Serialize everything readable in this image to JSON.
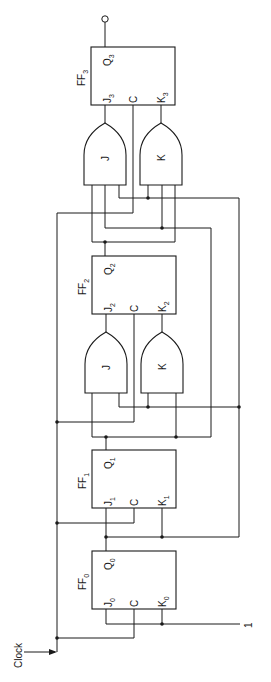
{
  "diagram": {
    "type": "synchronous counter (JK flip-flops with gate logic)",
    "orientation": "rotated 90deg counter-clockwise",
    "clock_label": "Clock",
    "constant_input_label": "1",
    "flip_flops": [
      {
        "id": "FF0",
        "name": "FF",
        "sub": "0",
        "q": "Q",
        "q_sub": "0",
        "j": "J",
        "j_sub": "0",
        "c": "C",
        "k": "K",
        "k_sub": "0"
      },
      {
        "id": "FF1",
        "name": "FF",
        "sub": "1",
        "q": "Q",
        "q_sub": "1",
        "j": "J",
        "j_sub": "1",
        "c": "C",
        "k": "K",
        "k_sub": "1"
      },
      {
        "id": "FF2",
        "name": "FF",
        "sub": "2",
        "q": "Q",
        "q_sub": "2",
        "j": "J",
        "j_sub": "2",
        "c": "C",
        "k": "K",
        "k_sub": "2"
      },
      {
        "id": "FF3",
        "name": "FF",
        "sub": "3",
        "q": "Q",
        "q_sub": "3",
        "j": "J",
        "j_sub": "3",
        "c": "C",
        "k": "K",
        "k_sub": "3"
      }
    ],
    "gates": [
      {
        "id": "FF2-J-gate",
        "label": "J"
      },
      {
        "id": "FF2-K-gate",
        "label": "K"
      },
      {
        "id": "FF3-J-gate",
        "label": "J"
      },
      {
        "id": "FF3-K-gate",
        "label": "K"
      }
    ],
    "colors": {
      "line": "#1a1a1a",
      "background": "#ffffff"
    }
  }
}
